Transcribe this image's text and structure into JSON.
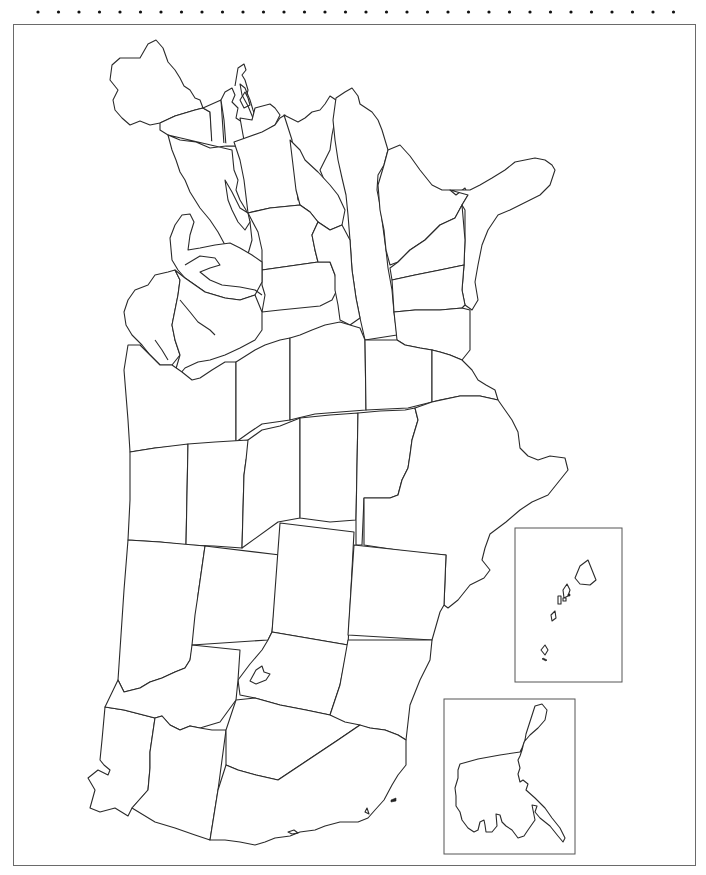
{
  "page": {
    "orientation": "rotated 90 degrees; Pacific coast at bottom, Atlantic coast at top-right",
    "colors": {
      "background": "#ffffff",
      "outline": "#2a2a2a",
      "frame": "#6a6a6a",
      "dots": "#111111"
    }
  },
  "perforation": {
    "dot_count": 32,
    "y": 12,
    "x_start": 38,
    "spacing": 20.5
  },
  "frame": {
    "x": 13,
    "y": 24,
    "width": 683,
    "height": 842
  },
  "insets": [
    {
      "name": "hawaii-inset",
      "x": 515,
      "y": 528,
      "width": 107,
      "height": 154
    },
    {
      "name": "alaska-inset",
      "x": 444,
      "y": 699,
      "width": 131,
      "height": 155
    }
  ],
  "labels": []
}
